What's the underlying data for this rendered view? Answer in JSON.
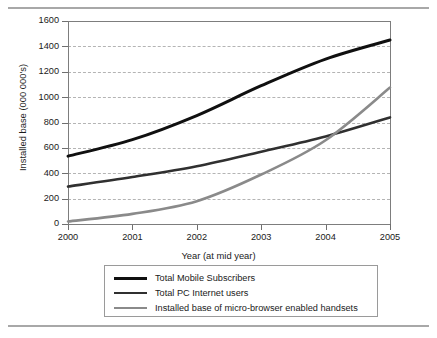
{
  "figure": {
    "top_rule": "horizontal-rule",
    "bottom_rule": "horizontal-rule"
  },
  "chart_data": {
    "type": "line",
    "title": "",
    "xlabel": "Year (at mid year)",
    "ylabel": "Installed base (000 000's)",
    "categories": [
      "2000",
      "2001",
      "2002",
      "2003",
      "2004",
      "2005"
    ],
    "x": [
      2000,
      2001,
      2002,
      2003,
      2004,
      2005
    ],
    "ylim": [
      0,
      1600
    ],
    "yticks": [
      0,
      200,
      400,
      600,
      800,
      1000,
      1200,
      1400,
      1600
    ],
    "ytick_labels": [
      "0",
      "200",
      "400",
      "600",
      "800",
      "1000",
      "1200",
      "1400",
      "1600"
    ],
    "grid": "horizontal-dashed",
    "legend_position": "below-plot",
    "series": [
      {
        "name": "Total Mobile Subscribers",
        "color": "#101010",
        "width": 3.0,
        "values": [
          535,
          665,
          855,
          1090,
          1300,
          1450
        ]
      },
      {
        "name": "Total PC Internet users",
        "color": "#303030",
        "width": 2.6,
        "values": [
          295,
          370,
          455,
          570,
          690,
          840
        ]
      },
      {
        "name": "Installed base of micro-browser enabled handsets",
        "color": "#8a8a8a",
        "width": 2.6,
        "values": [
          20,
          80,
          180,
          390,
          660,
          1075
        ]
      }
    ]
  },
  "legend": {
    "items": [
      {
        "label": "Total Mobile Subscribers",
        "color": "#101010"
      },
      {
        "label": "Total PC Internet users",
        "color": "#303030"
      },
      {
        "label": "Installed base of micro-browser enabled handsets",
        "color": "#8a8a8a"
      }
    ]
  }
}
